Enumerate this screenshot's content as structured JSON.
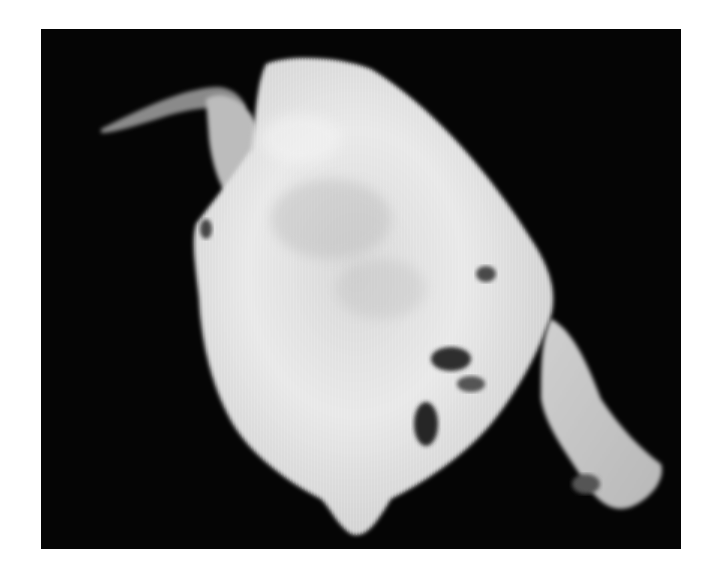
{
  "image": {
    "description": "Grayscale photograph of a pale, irregular tissue specimen on a black background",
    "colors": {
      "page_background": "#ffffff",
      "photo_background": "#050505",
      "specimen_light": "#e6e6e6",
      "specimen_mid": "#bdbdbd",
      "specimen_dark": "#3a3a3a"
    }
  }
}
